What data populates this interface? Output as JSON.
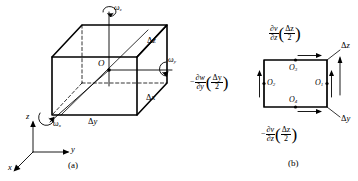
{
  "figure": {
    "type": "technical-diagram",
    "panels": [
      {
        "id": "a",
        "caption": "(a)",
        "description": "cubic fluid element with angular velocity components about x, y, z axes",
        "origin_label": "O",
        "dimension_labels": [
          {
            "name": "delta-z",
            "symbol": "Δ",
            "var": "z"
          },
          {
            "name": "delta-x",
            "symbol": "Δ",
            "var": "x"
          },
          {
            "name": "delta-y",
            "symbol": "Δ",
            "var": "y"
          }
        ],
        "rotation_labels": [
          {
            "name": "omega-z",
            "symbol": "ω",
            "sub": "z"
          },
          {
            "name": "omega-y",
            "symbol": "ω",
            "sub": "y"
          },
          {
            "name": "omega-x",
            "symbol": "ω",
            "sub": "x"
          }
        ],
        "axes": [
          {
            "name": "axis-z",
            "label": "z"
          },
          {
            "name": "axis-y",
            "label": "y"
          },
          {
            "name": "axis-x",
            "label": "x"
          }
        ]
      },
      {
        "id": "b",
        "caption": "(b)",
        "description": "projection of the element onto the y-z plane showing velocity increments on each face",
        "point_labels": [
          {
            "name": "point-o1",
            "symbol": "O",
            "sub": "1"
          },
          {
            "name": "point-o2",
            "symbol": "O",
            "sub": "2"
          },
          {
            "name": "point-o3",
            "symbol": "O",
            "sub": "3"
          },
          {
            "name": "point-o4",
            "symbol": "O",
            "sub": "4"
          }
        ],
        "dimension_labels": [
          {
            "name": "delta-z",
            "symbol": "Δ",
            "var": "z"
          },
          {
            "name": "delta-y",
            "symbol": "Δ",
            "var": "y"
          }
        ],
        "expressions": [
          {
            "name": "expr-top",
            "sign": "",
            "num": "∂v",
            "den": "∂z",
            "paren_num": "Δz",
            "paren_den": "2",
            "plain": "∂v/∂z (Δz/2)"
          },
          {
            "name": "expr-left",
            "sign": "−",
            "num": "∂w",
            "den": "∂y",
            "paren_num": "Δy",
            "paren_den": "2",
            "plain": "−∂w/∂y (Δy/2)"
          },
          {
            "name": "expr-bottom",
            "sign": "−",
            "num": "∂v",
            "den": "∂z",
            "paren_num": "Δz",
            "paren_den": "2",
            "plain": "−∂v/∂z (Δz/2)"
          }
        ]
      }
    ]
  },
  "colors": {
    "stroke": "#000000",
    "background": "#ffffff"
  }
}
